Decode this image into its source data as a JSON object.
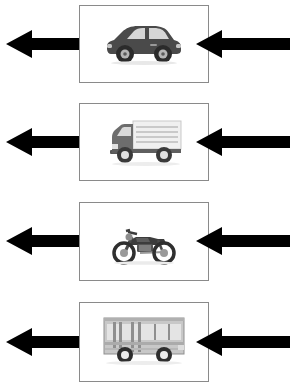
{
  "diagram": {
    "background_color": "#ffffff",
    "panel_border_color": "#8a8a8a",
    "arrow_color": "#000000",
    "panel_count": 4
  },
  "palette": {
    "car_body": "#4a4a4a",
    "car_glass": "#d6d6d6",
    "car_tire": "#2b2b2b",
    "truck_cab": "#6d6d6d",
    "truck_box": "#f0f0f0",
    "truck_line": "#bdbdbd",
    "truck_tire": "#3a3a3a",
    "moto_body": "#3c3c3c",
    "moto_detail": "#8c8c8c",
    "bus_body": "#c8c8c8",
    "bus_glass": "#e4e4e4",
    "bus_frame": "#8f8f8f",
    "bus_tire": "#2e2e2e"
  },
  "rows": [
    {
      "index": 1,
      "vehicle_name": "car",
      "vehicle_label": "Car",
      "panel": {
        "x": 79,
        "y": 5,
        "width": 130,
        "height": 78
      },
      "arrow_left": {
        "name": "arrow-left-outbound",
        "direction": "left",
        "x": 6,
        "width": 92
      },
      "arrow_right": {
        "name": "arrow-right-inbound",
        "direction": "left",
        "x": 196,
        "width": 94
      }
    },
    {
      "index": 2,
      "vehicle_name": "truck",
      "vehicle_label": "Truck",
      "panel": {
        "x": 79,
        "y": 103,
        "width": 130,
        "height": 78
      },
      "arrow_left": {
        "name": "arrow-left-outbound",
        "direction": "left",
        "x": 6,
        "width": 92
      },
      "arrow_right": {
        "name": "arrow-right-inbound",
        "direction": "left",
        "x": 196,
        "width": 94
      }
    },
    {
      "index": 3,
      "vehicle_name": "motorcycle",
      "vehicle_label": "Motorcycle",
      "panel": {
        "x": 79,
        "y": 202,
        "width": 130,
        "height": 79
      },
      "arrow_left": {
        "name": "arrow-left-outbound",
        "direction": "left",
        "x": 6,
        "width": 92
      },
      "arrow_right": {
        "name": "arrow-right-inbound",
        "direction": "left",
        "x": 196,
        "width": 94
      }
    },
    {
      "index": 4,
      "vehicle_name": "bus",
      "vehicle_label": "Bus",
      "panel": {
        "x": 79,
        "y": 302,
        "width": 130,
        "height": 80
      },
      "arrow_left": {
        "name": "arrow-left-outbound",
        "direction": "left",
        "x": 6,
        "width": 92
      },
      "arrow_right": {
        "name": "arrow-right-inbound",
        "direction": "left",
        "x": 196,
        "width": 94
      }
    }
  ]
}
